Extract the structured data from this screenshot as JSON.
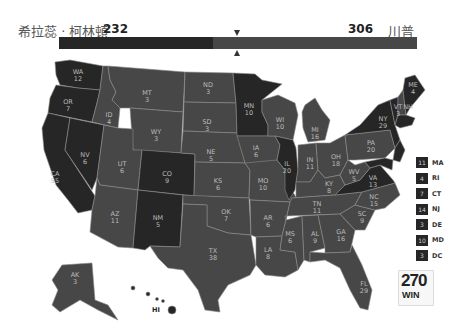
{
  "header": {
    "candidate_left": "希拉蕊 · 柯林頓",
    "ev_left": "232",
    "ev_right": "306",
    "candidate_right": "川普"
  },
  "colors": {
    "clinton": "#262626",
    "trump": "#474747",
    "border": "#8a8a8a",
    "label": "#bbbbbb"
  },
  "bar": {
    "left_value": 232,
    "right_value": 306,
    "total": 538,
    "threshold": 270
  },
  "states": {
    "WA": "12",
    "OR": "7",
    "CA": "55",
    "NV": "6",
    "ID": "4",
    "MT": "3",
    "WY": "3",
    "UT": "6",
    "AZ": "11",
    "CO": "9",
    "NM": "5",
    "ND": "3",
    "SD": "3",
    "NE": "5",
    "KS": "6",
    "OK": "7",
    "TX": "38",
    "MN": "10",
    "IA": "6",
    "MO": "10",
    "AR": "6",
    "LA": "8",
    "WI": "10",
    "IL": "20",
    "MI": "16",
    "IN": "11",
    "OH": "18",
    "KY": "8",
    "TN": "11",
    "MS": "6",
    "AL": "9",
    "GA": "16",
    "FL": "29",
    "SC": "9",
    "NC": "15",
    "VA": "13",
    "WV": "5",
    "PA": "20",
    "NY": "29",
    "VT": "3",
    "NH": "4",
    "ME": "4",
    "AK": "3",
    "HI": "4"
  },
  "legend": [
    {
      "ev": "11",
      "state": "MA"
    },
    {
      "ev": "4",
      "state": "RI"
    },
    {
      "ev": "7",
      "state": "CT"
    },
    {
      "ev": "14",
      "state": "NJ"
    },
    {
      "ev": "3",
      "state": "DE"
    },
    {
      "ev": "10",
      "state": "MD"
    },
    {
      "ev": "3",
      "state": "DC"
    }
  ],
  "logo": {
    "number": "270",
    "text": "WIN",
    "small": "TO"
  }
}
